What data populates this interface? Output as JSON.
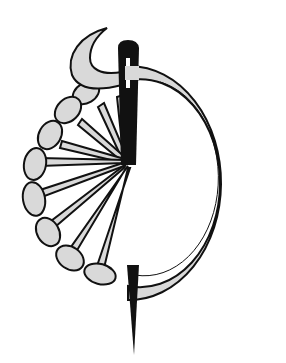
{
  "illustration": {
    "subject": "needle threaded through a crescent ring with fan of spokes and beads",
    "colors": {
      "background": "#ffffff",
      "fill_gray": "#d9d9d9",
      "ink": "#111111"
    },
    "elements": [
      "needle-icon",
      "ring-band",
      "horn-crescent",
      "bead-chain",
      "spoke-fan",
      "needle-point"
    ]
  }
}
